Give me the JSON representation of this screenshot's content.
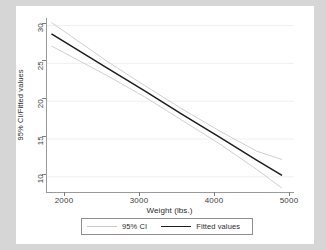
{
  "chart_data": {
    "type": "line",
    "title": "",
    "xlabel": "Weight (lbs.)",
    "ylabel": "95% CI/Fitted values",
    "xlim": [
      1700,
      5000
    ],
    "ylim": [
      8,
      31
    ],
    "xticks": [
      2000,
      3000,
      4000,
      5000
    ],
    "yticks": [
      10,
      15,
      20,
      25,
      30
    ],
    "grid": "horizontal",
    "legend_position": "bottom",
    "series": [
      {
        "name": "Fitted values",
        "color": "#1d1d1d",
        "x": [
          1760,
          2500,
          3000,
          3500,
          4000,
          4500,
          4840
        ],
        "y": [
          28.9,
          24.4,
          21.4,
          18.3,
          15.3,
          12.2,
          10.2
        ]
      },
      {
        "name": "95% CI upper",
        "color": "#c9c9c9",
        "x": [
          1760,
          2500,
          3000,
          3500,
          4000,
          4500,
          4840
        ],
        "y": [
          30.4,
          25.3,
          22.1,
          19.0,
          16.1,
          13.4,
          12.3
        ]
      },
      {
        "name": "95% CI lower",
        "color": "#c9c9c9",
        "x": [
          1760,
          2500,
          3000,
          3500,
          4000,
          4500,
          4840
        ],
        "y": [
          27.3,
          23.4,
          20.6,
          17.5,
          14.4,
          11.0,
          8.5
        ]
      }
    ],
    "legend": [
      {
        "label": "95% CI",
        "color": "#c9c9c9",
        "style": "thin"
      },
      {
        "label": "Fitted values",
        "color": "#1d1d1d",
        "style": "thick"
      }
    ]
  },
  "axes": {
    "y": {
      "title": "95% CI/Fitted values",
      "ticks": [
        "10",
        "15",
        "20",
        "25",
        "30"
      ]
    },
    "x": {
      "title": "Weight (lbs.)",
      "ticks": [
        "2000",
        "3000",
        "4000",
        "5000"
      ]
    }
  },
  "legend": {
    "ci_label": "95% CI",
    "fitted_label": "Fitted values"
  },
  "colors": {
    "ci_line": "#c9c9c9",
    "fitted_line": "#1d1d1d",
    "axis": "#9a9a9a",
    "grid": "#f0f0f0",
    "page_background": "#d6d6d6",
    "figure_background": "#ffffff"
  }
}
